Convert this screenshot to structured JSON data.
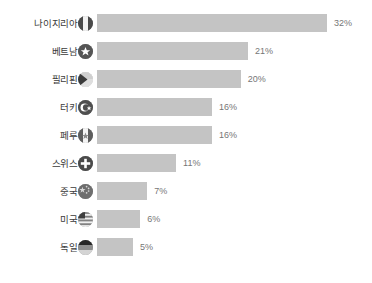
{
  "chart_data": {
    "type": "bar",
    "orientation": "horizontal",
    "title": "",
    "subtitle": "",
    "xlabel": "",
    "ylabel": "",
    "grid": false,
    "legend": false,
    "xlim": [
      0,
      32
    ],
    "value_suffix": "%",
    "categories": [
      "나이지리아",
      "베트남",
      "필리핀",
      "터키",
      "페루",
      "스위스",
      "중국",
      "미국",
      "독일"
    ],
    "values": [
      32,
      21,
      20,
      16,
      16,
      11,
      7,
      6,
      5
    ],
    "labels": [
      "32%",
      "21%",
      "20%",
      "16%",
      "16%",
      "11%",
      "7%",
      "6%",
      "5%"
    ],
    "bar_color": "#c4c4c4",
    "label_color": "#3b3b3b",
    "value_color": "#767676",
    "background": "#ffffff",
    "rows": [
      {
        "category": "나이지리아",
        "value": 32,
        "label": "32%",
        "flag_icon": "flag-nigeria-icon"
      },
      {
        "category": "베트남",
        "value": 21,
        "label": "21%",
        "flag_icon": "flag-vietnam-icon"
      },
      {
        "category": "필리핀",
        "value": 20,
        "label": "20%",
        "flag_icon": "flag-philippines-icon"
      },
      {
        "category": "터키",
        "value": 16,
        "label": "16%",
        "flag_icon": "flag-turkey-icon"
      },
      {
        "category": "페루",
        "value": 16,
        "label": "16%",
        "flag_icon": "flag-peru-icon"
      },
      {
        "category": "스위스",
        "value": 11,
        "label": "11%",
        "flag_icon": "flag-switzerland-icon"
      },
      {
        "category": "중국",
        "value": 7,
        "label": "7%",
        "flag_icon": "flag-china-icon"
      },
      {
        "category": "미국",
        "value": 6,
        "label": "6%",
        "flag_icon": "flag-usa-icon"
      },
      {
        "category": "독일",
        "value": 5,
        "label": "5%",
        "flag_icon": "flag-germany-icon"
      }
    ]
  }
}
